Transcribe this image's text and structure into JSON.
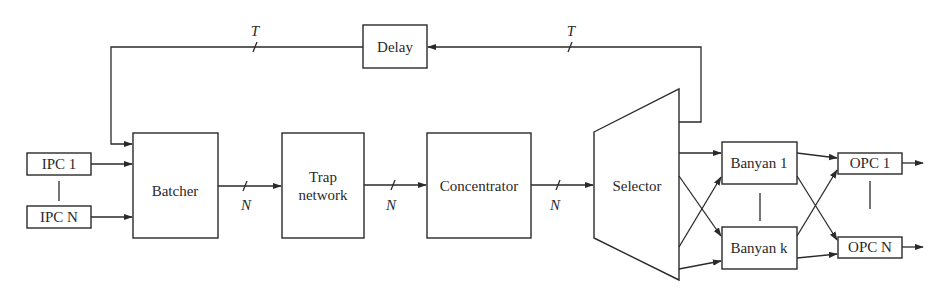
{
  "diagram": {
    "type": "block-diagram",
    "title": "",
    "blocks": {
      "ipc_first": "IPC 1",
      "ipc_last": "IPC N",
      "batcher": "Batcher",
      "trap_line1": "Trap",
      "trap_line2": "network",
      "concentrator": "Concentrator",
      "selector": "Selector",
      "delay": "Delay",
      "banyan_first": "Banyan 1",
      "banyan_last": "Banyan k",
      "opc_first": "OPC 1",
      "opc_last": "OPC N"
    },
    "bus_labels": {
      "batcher_to_trap": "N",
      "trap_to_concentrator": "N",
      "concentrator_to_selector": "N",
      "delay_to_batcher": "T",
      "selector_to_delay": "T"
    },
    "connections": [
      {
        "from": "IPC 1",
        "to": "Batcher"
      },
      {
        "from": "IPC N",
        "to": "Batcher"
      },
      {
        "from": "Batcher",
        "to": "Trap network",
        "width": "N"
      },
      {
        "from": "Trap network",
        "to": "Concentrator",
        "width": "N"
      },
      {
        "from": "Concentrator",
        "to": "Selector",
        "width": "N"
      },
      {
        "from": "Selector",
        "to": "Delay",
        "width": "T"
      },
      {
        "from": "Delay",
        "to": "Batcher",
        "width": "T"
      },
      {
        "from": "Selector",
        "to": "Banyan 1"
      },
      {
        "from": "Selector",
        "to": "Banyan k"
      },
      {
        "from": "Banyan 1",
        "to": "OPC 1"
      },
      {
        "from": "Banyan 1",
        "to": "OPC N"
      },
      {
        "from": "Banyan k",
        "to": "OPC 1"
      },
      {
        "from": "Banyan k",
        "to": "OPC N"
      }
    ],
    "colors": {
      "stroke": "#2a2a2a",
      "background": "#ffffff"
    }
  }
}
